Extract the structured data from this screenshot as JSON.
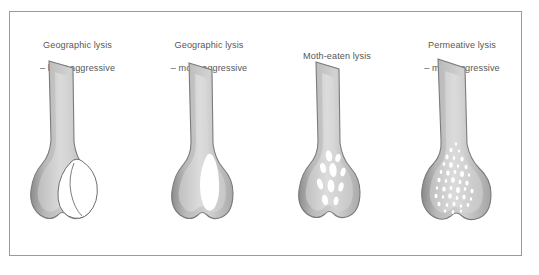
{
  "figure": {
    "border_color": "#9a9a9a",
    "background_color": "#ffffff",
    "text_color": "#575757",
    "bone_cortex_color": "#9b9b9b",
    "bone_outline_color": "#7d7d7d",
    "bone_marrow_color": "#c9c9c9",
    "lesion_color": "#ffffff"
  },
  "panels": [
    {
      "id": "geographic-least-aggressive",
      "caption": "Geographic lysis\n– least aggressive",
      "caption_line1": "Geographic lysis",
      "caption_line2": "– least aggressive",
      "lysis_pattern": "geographic",
      "aggressiveness": "least aggressive",
      "lesion_description": "single large well-defined lucency with sharp sclerotic margin in distal metaphysis, expanding beyond cortex",
      "lesion_count": 1
    },
    {
      "id": "geographic-more-aggressive",
      "caption": "Geographic lysis\n– more aggressive",
      "caption_line1": "Geographic lysis",
      "caption_line2": "– more aggressive",
      "lysis_pattern": "geographic",
      "aggressiveness": "more aggressive",
      "lesion_description": "single elongated lucency with less defined margin in medullary canal",
      "lesion_count": 1
    },
    {
      "id": "moth-eaten",
      "caption": "Moth-eaten lysis",
      "caption_line1": "Moth-eaten lysis",
      "caption_line2": "",
      "lysis_pattern": "moth-eaten",
      "aggressiveness": "",
      "lesion_description": "multiple medium-sized oval lucencies of varying size scattered in medullary canal",
      "lesion_count": 9
    },
    {
      "id": "permeative",
      "caption": "Permeative lysis\n– most aggressive",
      "caption_line1": "Permeative lysis",
      "caption_line2": "– most aggressive",
      "lysis_pattern": "permeative",
      "aggressiveness": "most aggressive",
      "lesion_description": "numerous tiny ill-defined dot-like lucencies permeating the distal shaft and metaphysis",
      "lesion_count": 60
    }
  ]
}
